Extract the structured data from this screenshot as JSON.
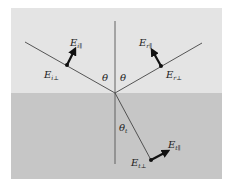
{
  "diagram": {
    "colors": {
      "upper_medium": "#e4e4e4",
      "lower_medium": "#c6c6c6",
      "line": "#333333",
      "arrow": "#111111",
      "background": "#ffffff"
    },
    "angles": {
      "incident": "θ",
      "reflected": "θ",
      "transmitted": "θt"
    },
    "labels": {
      "incident_parallel": {
        "base": "E",
        "sub": "i∥"
      },
      "incident_perp": {
        "base": "E",
        "sub": "i⊥"
      },
      "reflected_parallel": {
        "base": "E",
        "sub": "r∥"
      },
      "reflected_perp": {
        "base": "E",
        "sub": "r⊥"
      },
      "transmitted_parallel": {
        "base": "E",
        "sub": "t∥"
      },
      "transmitted_perp": {
        "base": "E",
        "sub": "t⊥"
      }
    },
    "theta_symbol": "θ",
    "theta_t_sub": "t"
  }
}
